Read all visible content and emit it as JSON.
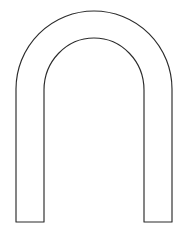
{
  "canvas": {
    "width": 189,
    "height": 233,
    "background_color": "#ffffff",
    "title": "Arch Outline"
  },
  "figure": {
    "name": "arch-shape",
    "stroke_color": "#2b2b2b",
    "fill_color": "#ffffff",
    "stroke_width": 1.15,
    "geometry": {
      "outer_left_x": 16,
      "outer_right_x": 172,
      "outer_apex_y": 11,
      "outer_radius_x": 78,
      "outer_radius_y": 78,
      "outer_curve_end_y": 89,
      "inner_left_x": 44,
      "inner_right_x": 144,
      "inner_apex_y": 38,
      "inner_radius_x": 50,
      "inner_radius_y": 52,
      "inner_curve_end_y": 90,
      "bottom_y": 222,
      "leg_width_left": 28,
      "leg_width_right": 28,
      "crown_thickness": 27
    },
    "path": "M 16 222 L 16 89 A 78 78 0 0 1 172 89 L 172 222 L 144 222 L 144 90 A 50 52 0 0 0 44 90 L 44 222 Z"
  }
}
